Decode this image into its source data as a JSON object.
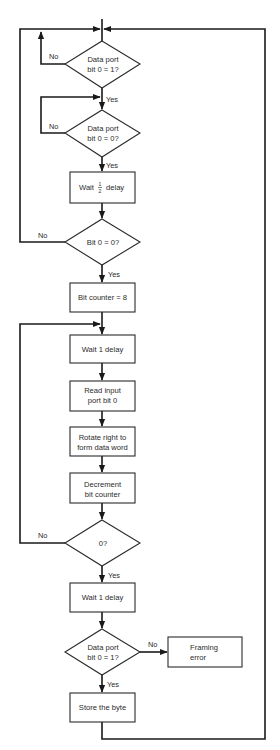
{
  "flowchart": {
    "nodes": {
      "d1": {
        "type": "decision",
        "line1": "Data port",
        "line2": "bit 0 = 1?"
      },
      "d2": {
        "type": "decision",
        "line1": "Data port",
        "line2": "bit 0 = 0?"
      },
      "p1": {
        "type": "process",
        "pre": "Wait",
        "frac_num": "1",
        "frac_den": "2",
        "post": "delay"
      },
      "d3": {
        "type": "decision",
        "line1": "Bit 0 = 0?"
      },
      "p2": {
        "type": "process",
        "line1": "Bit counter = 8"
      },
      "p3": {
        "type": "process",
        "line1": "Wait 1 delay"
      },
      "p4": {
        "type": "process",
        "line1": "Read input",
        "line2": "port bit 0"
      },
      "p5": {
        "type": "process",
        "line1": "Rotate right to",
        "line2": "form data word"
      },
      "p6": {
        "type": "process",
        "line1": "Decrement",
        "line2": "bit counter"
      },
      "d4": {
        "type": "decision",
        "line1": "0?"
      },
      "p7": {
        "type": "process",
        "line1": "Wait 1 delay"
      },
      "d5": {
        "type": "decision",
        "line1": "Data port",
        "line2": "bit 0 = 1?"
      },
      "p8": {
        "type": "process",
        "line1": "Framing",
        "line2": "error"
      },
      "p9": {
        "type": "process",
        "line1": "Store the byte"
      }
    },
    "edge_labels": {
      "d1_no": "No",
      "d1_yes": "Yes",
      "d2_no": "No",
      "d2_yes": "Yes",
      "d3_no": "No",
      "d3_yes": "Yes",
      "d4_no": "No",
      "d4_yes": "Yes",
      "d5_no": "No",
      "d5_yes": "Yes"
    },
    "colors": {
      "line": "#1a1a1a",
      "background": "#ffffff"
    }
  }
}
